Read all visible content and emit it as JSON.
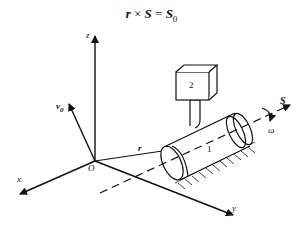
{
  "formula": {
    "lhs1": "r",
    "op": "×",
    "lhs2": "S",
    "eq": "=",
    "rhs": "S",
    "rhs_sub": "0"
  },
  "labels": {
    "z": "z",
    "x": "x",
    "y": "y",
    "origin": "O",
    "v0": "v",
    "v0_sub": "0",
    "r": "r",
    "S": "S",
    "omega": "ω",
    "body1": "1",
    "body2": "2"
  },
  "colors": {
    "stroke": "#111111",
    "background": "#ffffff"
  }
}
